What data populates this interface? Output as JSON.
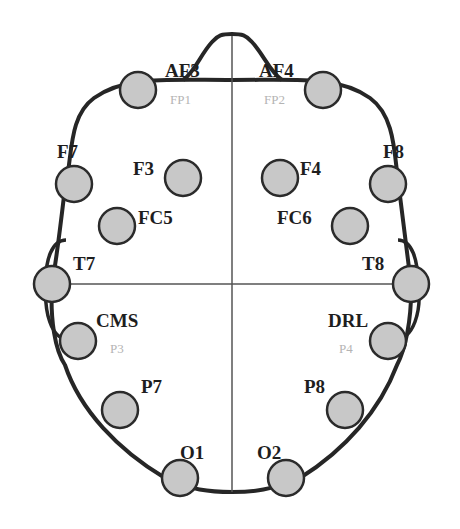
{
  "colors": {
    "outline": "#262626",
    "midline": "#555555",
    "electrode_fill": "#c8c8c8",
    "electrode_stroke": "#2b2b2b",
    "label": "#1e1e1e",
    "sublabel": "#b4b4b4"
  },
  "electrodes": [
    {
      "id": "AF3",
      "label": "AF3",
      "sublabel": "FP1",
      "cx": 138,
      "cy": 90,
      "lx": 165,
      "ly": 77,
      "sx": 170,
      "sy": 104
    },
    {
      "id": "AF4",
      "label": "AF4",
      "sublabel": "FP2",
      "cx": 323,
      "cy": 90,
      "lx": 259,
      "ly": 77,
      "sx": 264,
      "sy": 104
    },
    {
      "id": "F7",
      "label": "F7",
      "sublabel": "",
      "cx": 74,
      "cy": 184,
      "lx": 57,
      "ly": 158,
      "sx": 0,
      "sy": 0
    },
    {
      "id": "F8",
      "label": "F8",
      "sublabel": "",
      "cx": 388,
      "cy": 184,
      "lx": 383,
      "ly": 158,
      "sx": 0,
      "sy": 0
    },
    {
      "id": "F3",
      "label": "F3",
      "sublabel": "",
      "cx": 183,
      "cy": 178,
      "lx": 133,
      "ly": 175,
      "sx": 0,
      "sy": 0
    },
    {
      "id": "F4",
      "label": "F4",
      "sublabel": "",
      "cx": 280,
      "cy": 178,
      "lx": 300,
      "ly": 175,
      "sx": 0,
      "sy": 0
    },
    {
      "id": "FC5",
      "label": "FC5",
      "sublabel": "",
      "cx": 117,
      "cy": 226,
      "lx": 138,
      "ly": 224,
      "sx": 0,
      "sy": 0
    },
    {
      "id": "FC6",
      "label": "FC6",
      "sublabel": "",
      "cx": 350,
      "cy": 226,
      "lx": 277,
      "ly": 224,
      "sx": 0,
      "sy": 0
    },
    {
      "id": "T7",
      "label": "T7",
      "sublabel": "",
      "cx": 52,
      "cy": 284,
      "lx": 73,
      "ly": 270,
      "sx": 0,
      "sy": 0
    },
    {
      "id": "T8",
      "label": "T8",
      "sublabel": "",
      "cx": 411,
      "cy": 284,
      "lx": 362,
      "ly": 270,
      "sx": 0,
      "sy": 0
    },
    {
      "id": "CMS",
      "label": "CMS",
      "sublabel": "P3",
      "cx": 78,
      "cy": 341,
      "lx": 96,
      "ly": 327,
      "sx": 110,
      "sy": 353
    },
    {
      "id": "DRL",
      "label": "DRL",
      "sublabel": "P4",
      "cx": 388,
      "cy": 341,
      "lx": 328,
      "ly": 327,
      "sx": 339,
      "sy": 353
    },
    {
      "id": "P7",
      "label": "P7",
      "sublabel": "",
      "cx": 120,
      "cy": 410,
      "lx": 141,
      "ly": 393,
      "sx": 0,
      "sy": 0
    },
    {
      "id": "P8",
      "label": "P8",
      "sublabel": "",
      "cx": 345,
      "cy": 410,
      "lx": 304,
      "ly": 393,
      "sx": 0,
      "sy": 0
    },
    {
      "id": "O1",
      "label": "O1",
      "sublabel": "",
      "cx": 180,
      "cy": 478,
      "lx": 180,
      "ly": 459,
      "sx": 0,
      "sy": 0
    },
    {
      "id": "O2",
      "label": "O2",
      "sublabel": "",
      "cx": 286,
      "cy": 478,
      "lx": 257,
      "ly": 459,
      "sx": 0,
      "sy": 0
    }
  ],
  "electrode_radius": 18
}
